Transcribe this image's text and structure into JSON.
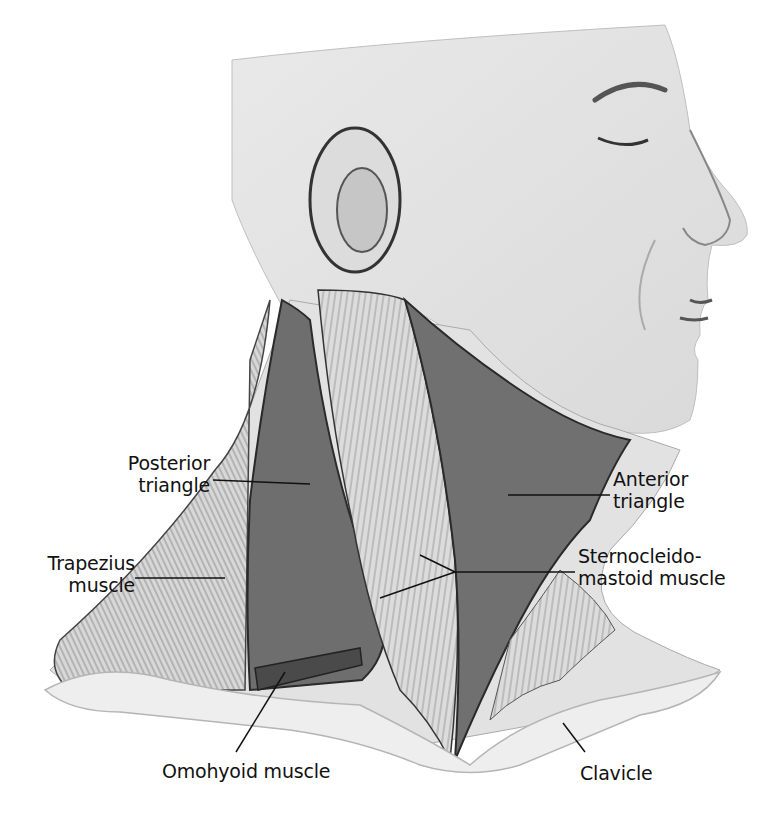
{
  "figure": {
    "palette": {
      "skin": "#e6e6e6",
      "skin_shadow": "#bdbdbd",
      "muscle_band": "#d2d2d2",
      "triangle_fill": "#6e6e6e",
      "outline": "#2a2a2a",
      "label_text": "#111111",
      "background": "#ffffff"
    }
  },
  "labels": [
    {
      "id": "posterior-triangle",
      "line1": "Posterior",
      "line2": "triangle"
    },
    {
      "id": "trapezius-muscle",
      "line1": "Trapezius",
      "line2": "muscle"
    },
    {
      "id": "anterior-triangle",
      "line1": "Anterior",
      "line2": "triangle"
    },
    {
      "id": "sternocleidomastoid-muscle",
      "line1": "Sternocleido-",
      "line2": "mastoid muscle"
    },
    {
      "id": "omohyoid-muscle",
      "line1": "Omohyoid muscle"
    },
    {
      "id": "clavicle",
      "line1": "Clavicle"
    }
  ]
}
